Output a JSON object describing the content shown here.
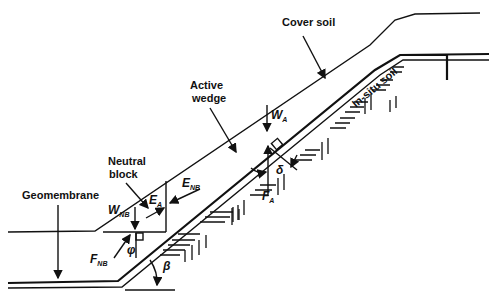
{
  "figure": {
    "labels": {
      "cover_soil": "Cover soil",
      "in_situ_soil": "In-situ soil",
      "active_wedge_line1": "Active",
      "active_wedge_line2": "wedge",
      "neutral_block_line1": "Neutral",
      "neutral_block_line2": "block",
      "geomembrane": "Geomembrane"
    },
    "symbols": {
      "W_A": {
        "main": "W",
        "sub": "A"
      },
      "F_A": {
        "main": "F",
        "sub": "A"
      },
      "E_A": {
        "main": "E",
        "sub": "A"
      },
      "E_NB": {
        "main": "E",
        "sub": "NB"
      },
      "W_NB": {
        "main": "W",
        "sub": "NB"
      },
      "F_NB": {
        "main": "F",
        "sub": "NB"
      },
      "delta": "δ",
      "phi": "φ",
      "beta": "β"
    }
  }
}
